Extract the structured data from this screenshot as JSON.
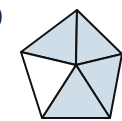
{
  "label": {
    "text": ")"
  },
  "figure": {
    "shape": "regular pentagon divided into 5 triangles from center",
    "fill_shaded": "#cfdde9",
    "fill_unshaded": "#ffffff",
    "stroke": "#111111",
    "vertices": {
      "top": [
        77,
        10
      ],
      "right": [
        122,
        54
      ],
      "bottom_right": [
        110,
        118
      ],
      "bottom_left": [
        42,
        118
      ],
      "left": [
        21,
        52
      ]
    },
    "center": [
      76,
      65
    ],
    "triangles": [
      {
        "name": "top-left",
        "shaded": true
      },
      {
        "name": "top-right",
        "shaded": true
      },
      {
        "name": "right",
        "shaded": true
      },
      {
        "name": "bottom",
        "shaded": true
      },
      {
        "name": "left",
        "shaded": false
      }
    ],
    "shaded_count": 4,
    "total_count": 5
  }
}
